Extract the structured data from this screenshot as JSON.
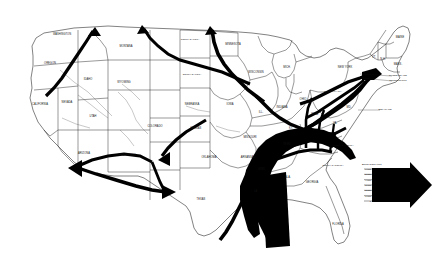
{
  "figure": {
    "name": "us-natural-gas-flow-map",
    "background_color": "#ffffff",
    "ink_color": "#000000"
  },
  "legend": {
    "title": "Billion Cubic Feet",
    "arrow_icon": "right-arrow-icon",
    "ticks": [
      "6,000",
      "5,000",
      "4,000",
      "3,000",
      "2,000",
      "1,000",
      "0"
    ]
  },
  "states": [
    {
      "id": "washington",
      "label": "WASHINGTON",
      "x": 62,
      "y": 35
    },
    {
      "id": "oregon",
      "label": "OREGON",
      "x": 50,
      "y": 64
    },
    {
      "id": "california",
      "label": "CALIFORNIA",
      "x": 40,
      "y": 105
    },
    {
      "id": "idaho",
      "label": "IDAHO",
      "x": 88,
      "y": 80
    },
    {
      "id": "nevada",
      "label": "NEVADA",
      "x": 67,
      "y": 103
    },
    {
      "id": "montana",
      "label": "MONTANA",
      "x": 126,
      "y": 47
    },
    {
      "id": "wyoming",
      "label": "WYOMING",
      "x": 124,
      "y": 83
    },
    {
      "id": "utah",
      "label": "UTAH",
      "x": 93,
      "y": 117
    },
    {
      "id": "arizona",
      "label": "ARIZONA",
      "x": 84,
      "y": 154
    },
    {
      "id": "new-mexico",
      "label": "NEW MEXICO",
      "x": 127,
      "y": 156
    },
    {
      "id": "colorado",
      "label": "COLORADO",
      "x": 155,
      "y": 127
    },
    {
      "id": "north-dakota",
      "label": "NORTH DAKOTA",
      "x": 190,
      "y": 40
    },
    {
      "id": "south-dakota",
      "label": "SOUTH DAKOTA",
      "x": 192,
      "y": 75
    },
    {
      "id": "nebraska",
      "label": "NEBRASKA",
      "x": 192,
      "y": 105
    },
    {
      "id": "kansas",
      "label": "KANSAS",
      "x": 196,
      "y": 129
    },
    {
      "id": "oklahoma",
      "label": "OKLAHOMA",
      "x": 209,
      "y": 158
    },
    {
      "id": "texas",
      "label": "TEXAS",
      "x": 201,
      "y": 200
    },
    {
      "id": "minnesota",
      "label": "MINNESOTA",
      "x": 233,
      "y": 45
    },
    {
      "id": "iowa",
      "label": "IOWA",
      "x": 230,
      "y": 105
    },
    {
      "id": "missouri",
      "label": "MISSOURI",
      "x": 250,
      "y": 138
    },
    {
      "id": "arkansas",
      "label": "ARKANSAS",
      "x": 248,
      "y": 158
    },
    {
      "id": "wisconsin",
      "label": "WISCONSIN",
      "x": 256,
      "y": 73
    },
    {
      "id": "illinois",
      "label": "ILL.",
      "x": 261,
      "y": 113
    },
    {
      "id": "indiana",
      "label": "INDIANA",
      "x": 282,
      "y": 108
    },
    {
      "id": "ohio",
      "label": "OHIO",
      "x": 303,
      "y": 100
    },
    {
      "id": "michigan",
      "label": "MICH.",
      "x": 287,
      "y": 68
    },
    {
      "id": "kentucky",
      "label": "KY.",
      "x": 291,
      "y": 129
    },
    {
      "id": "tennessee",
      "label": "TENN.",
      "x": 287,
      "y": 145
    },
    {
      "id": "mississippi",
      "label": "MISS.",
      "x": 262,
      "y": 170
    },
    {
      "id": "alabama",
      "label": "ALA.",
      "x": 288,
      "y": 178
    },
    {
      "id": "louisiana",
      "label": "LA.",
      "x": 256,
      "y": 192
    },
    {
      "id": "georgia",
      "label": "GEORGIA",
      "x": 312,
      "y": 183
    },
    {
      "id": "florida",
      "label": "FLORIDA",
      "x": 338,
      "y": 225
    },
    {
      "id": "south-carolina",
      "label": "SOUTH CAROLINA",
      "x": 333,
      "y": 166
    },
    {
      "id": "north-carolina",
      "label": "NORTH CAROLINA",
      "x": 343,
      "y": 146
    },
    {
      "id": "virginia",
      "label": "VA.",
      "x": 335,
      "y": 124
    },
    {
      "id": "west-virginia",
      "label": "W.VA.",
      "x": 315,
      "y": 115
    },
    {
      "id": "pennsylvania",
      "label": "PENNSYLVANIA",
      "x": 333,
      "y": 92
    },
    {
      "id": "new-york",
      "label": "NEW YORK",
      "x": 345,
      "y": 68
    },
    {
      "id": "maine",
      "label": "MAINE",
      "x": 400,
      "y": 38
    },
    {
      "id": "vermont",
      "label": "VT.",
      "x": 374,
      "y": 58
    },
    {
      "id": "new-hampshire",
      "label": "N.H.",
      "x": 383,
      "y": 60
    },
    {
      "id": "massachusetts",
      "label": "MASS.",
      "x": 398,
      "y": 65
    },
    {
      "id": "maryland",
      "label": "MD.",
      "x": 349,
      "y": 108
    }
  ],
  "callouts": [
    {
      "id": "rhode-island",
      "label": "RHODE ISLAND",
      "x": 398,
      "y": 76
    },
    {
      "id": "connecticut",
      "label": "CONNECTICUT",
      "x": 398,
      "y": 81
    },
    {
      "id": "delaware",
      "label": "DELAWARE",
      "x": 385,
      "y": 110
    }
  ]
}
